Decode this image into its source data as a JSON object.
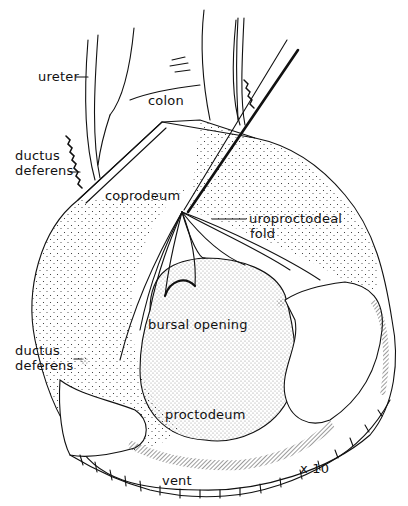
{
  "figure": {
    "type": "anatomical line drawing (stippled)",
    "magnification": "x 10",
    "colors": {
      "ink": "#111111",
      "background": "#ffffff"
    }
  },
  "labels": {
    "ureter": "ureter",
    "colon": "colon",
    "ductus_deferens_top_line1": "ductus",
    "ductus_deferens_top_line2": "deferens",
    "coprodeum": "coprodeum",
    "uroproctodeal_fold_line1": "uroproctodeal",
    "uroproctodeal_fold_line2": "fold",
    "bursal_opening": "bursal opening",
    "ductus_deferens_bottom_line1": "ductus",
    "ductus_deferens_bottom_line2": "deferens",
    "proctodeum": "proctodeum",
    "vent": "vent",
    "magnification": "x 10"
  }
}
